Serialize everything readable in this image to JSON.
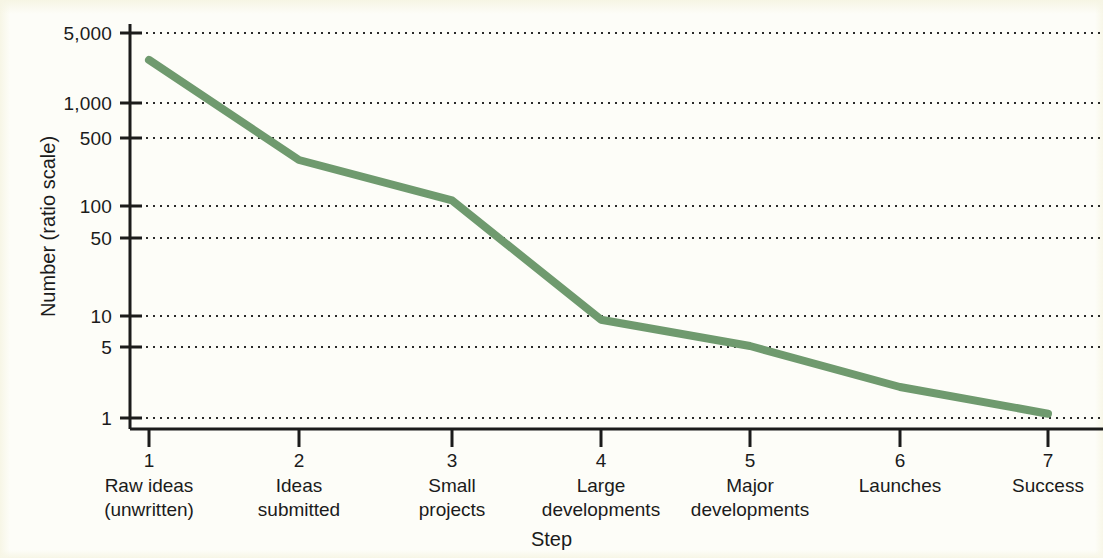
{
  "chart_data": {
    "type": "line",
    "title": "",
    "xlabel": "Step",
    "ylabel": "Number (ratio scale)",
    "yscale": "log",
    "ylim": [
      1,
      6000
    ],
    "grid": true,
    "legend": "none",
    "line_color": "#6f9a6e",
    "categories": [
      1,
      2,
      3,
      4,
      5,
      6,
      7
    ],
    "category_labels": [
      "Raw ideas\n(unwritten)",
      "Ideas\nsubmitted",
      "Small\nprojects",
      "Large\ndevelopments",
      "Major\ndevelopments",
      "Launches",
      "Success"
    ],
    "ytick_labels": [
      "5,000",
      "1,000",
      "500",
      "100",
      "50",
      "10",
      "5",
      "1"
    ],
    "ytick_values": [
      5000,
      1000,
      500,
      100,
      50,
      10,
      5,
      1
    ],
    "values": [
      3000,
      320,
      130,
      9,
      5,
      2,
      1.1
    ],
    "series": [
      {
        "name": "Number of items at step",
        "values": [
          3000,
          320,
          130,
          9,
          5,
          2,
          1.1
        ]
      }
    ]
  },
  "axes": {
    "y_label": "Number (ratio scale)",
    "x_label": "Step",
    "y_ticks": [
      {
        "label": "5,000",
        "value": 5000
      },
      {
        "label": "1,000",
        "value": 1000
      },
      {
        "label": "500",
        "value": 500
      },
      {
        "label": "100",
        "value": 100
      },
      {
        "label": "50",
        "value": 50
      },
      {
        "label": "10",
        "value": 10
      },
      {
        "label": "5",
        "value": 5
      },
      {
        "label": "1",
        "value": 1
      }
    ],
    "x_ticks": [
      {
        "number": "1",
        "line1": "Raw ideas",
        "line2": "(unwritten)"
      },
      {
        "number": "2",
        "line1": "Ideas",
        "line2": "submitted"
      },
      {
        "number": "3",
        "line1": "Small",
        "line2": "projects"
      },
      {
        "number": "4",
        "line1": "Large",
        "line2": "developments"
      },
      {
        "number": "5",
        "line1": "Major",
        "line2": "developments"
      },
      {
        "number": "6",
        "line1": "Launches",
        "line2": ""
      },
      {
        "number": "7",
        "line1": "Success",
        "line2": ""
      }
    ]
  },
  "colors": {
    "line": "#6f9a6e",
    "axis": "#1b1b1b",
    "grid": "#2a2a2a",
    "background": "#fdfdf8"
  }
}
